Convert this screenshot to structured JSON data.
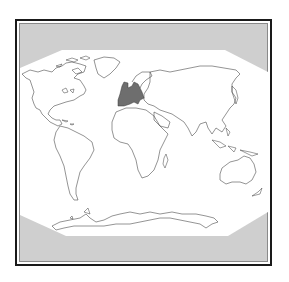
{
  "map": {
    "type": "world-outline-map",
    "projection": "pseudocylindrical (octagonal frame)",
    "highlighted_region": "Europe",
    "colors": {
      "background": "#ffffff",
      "frame_border": "#1a1a1a",
      "inner_border": "#8a8a8a",
      "outside_map_fill": "#cfcfcf",
      "ocean": "#ffffff",
      "coastline": "#3a3a3a",
      "highlight": "#6e6e6e"
    },
    "continents": [
      "North America",
      "South America",
      "Europe",
      "Africa",
      "Asia",
      "Australia",
      "Antarctica"
    ]
  }
}
